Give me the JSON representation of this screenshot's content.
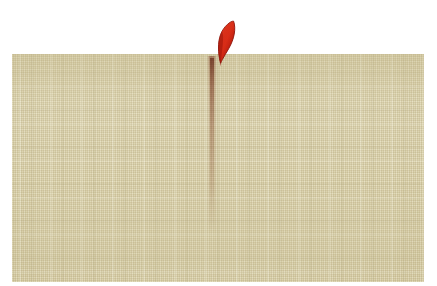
{
  "scene": {
    "title": "Linen fabric swatch with red leaf mark",
    "background_color": "#ffffff",
    "width": 437,
    "height": 286
  },
  "fabric": {
    "name": "woven linen swatch",
    "base_color": "#d6cca4",
    "highlight_color": "#e6dec0",
    "shadow_color": "#b8ab7c",
    "weave": "plain woven warp and weft with irregular slubs",
    "edges": "soft faded rounded edges, bottom-left most diffuse",
    "bounds": {
      "left": 12,
      "top": 54,
      "width": 412,
      "height": 228
    }
  },
  "red_mark": {
    "name": "red leaf shape",
    "fill_color": "#c4170f",
    "edge_color": "#8e0f09",
    "highlight_color": "#e03a22",
    "description": "pointed leaf or flame form rising above the top edge of the cloth",
    "bounds": {
      "left": 206,
      "top": 18,
      "width": 40,
      "height": 50
    }
  },
  "stain_streak": {
    "name": "vertical reddish stain streak",
    "color": "#96402f",
    "description": "faint rust coloured run descending from the red mark down the cloth",
    "bounds": {
      "left": 207,
      "top": 56,
      "width": 10,
      "height": 176
    }
  }
}
